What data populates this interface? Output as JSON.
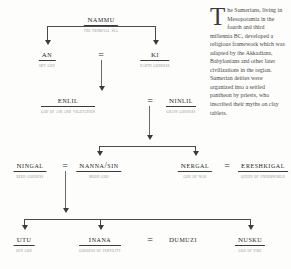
{
  "figure": {
    "type": "genealogy-diagram"
  },
  "nodes": {
    "nammu": {
      "name": "NAMMU",
      "epithet": "THE PRIMEVAL SEA"
    },
    "an": {
      "name": "AN",
      "epithet": "SKY GOD"
    },
    "ki": {
      "name": "KI",
      "epithet": "EARTH GODDESS"
    },
    "enlil": {
      "name": "ENLIL",
      "epithet": "GOD OF AIR AND VEGETATION"
    },
    "ninlil": {
      "name": "NINLIL",
      "epithet": "GRAIN GODDESS"
    },
    "ningal": {
      "name": "NINGAL",
      "epithet": "REED GODDESS"
    },
    "nanna_sin": {
      "name": "NANNA/SIN",
      "epithet": "MOON GOD"
    },
    "nergal": {
      "name": "NERGAL",
      "epithet": "GOD OF WAR"
    },
    "ereshkigal": {
      "name": "ERESHKIGAL",
      "epithet": "QUEEN OF UNDERWORLD"
    },
    "utu": {
      "name": "UTU",
      "epithet": "SUN GOD"
    },
    "inana": {
      "name": "INANA",
      "epithet": "GODDESS OF FERTILITY"
    },
    "dumuzi": {
      "name": "DUMUZI",
      "epithet": ""
    },
    "nusku": {
      "name": "NUSKU",
      "epithet": "GOD OF FIRE"
    }
  },
  "unions": {
    "an_ki": "=",
    "enlil_ninlil": "=",
    "ningal_nanna": "=",
    "nergal_eresh": "=",
    "inana_dumuzi": "="
  },
  "sidetext": {
    "dropcap": "T",
    "body": "he Sumerians, living in Mesopotamia in the fourth and third millennia BC, developed a religious framework which was adapted by the Akkadians, Babylonians and other later civilizations in the region. Sumerian deities were organized into a settled pantheon by priests, who inscribed their myths on clay tablets."
  },
  "colors": {
    "ink": "#262626",
    "epithet": "#8a8a86",
    "rule": "#3a3a3a",
    "connector": "#4a4a4a",
    "background": "#fdfdfc"
  }
}
